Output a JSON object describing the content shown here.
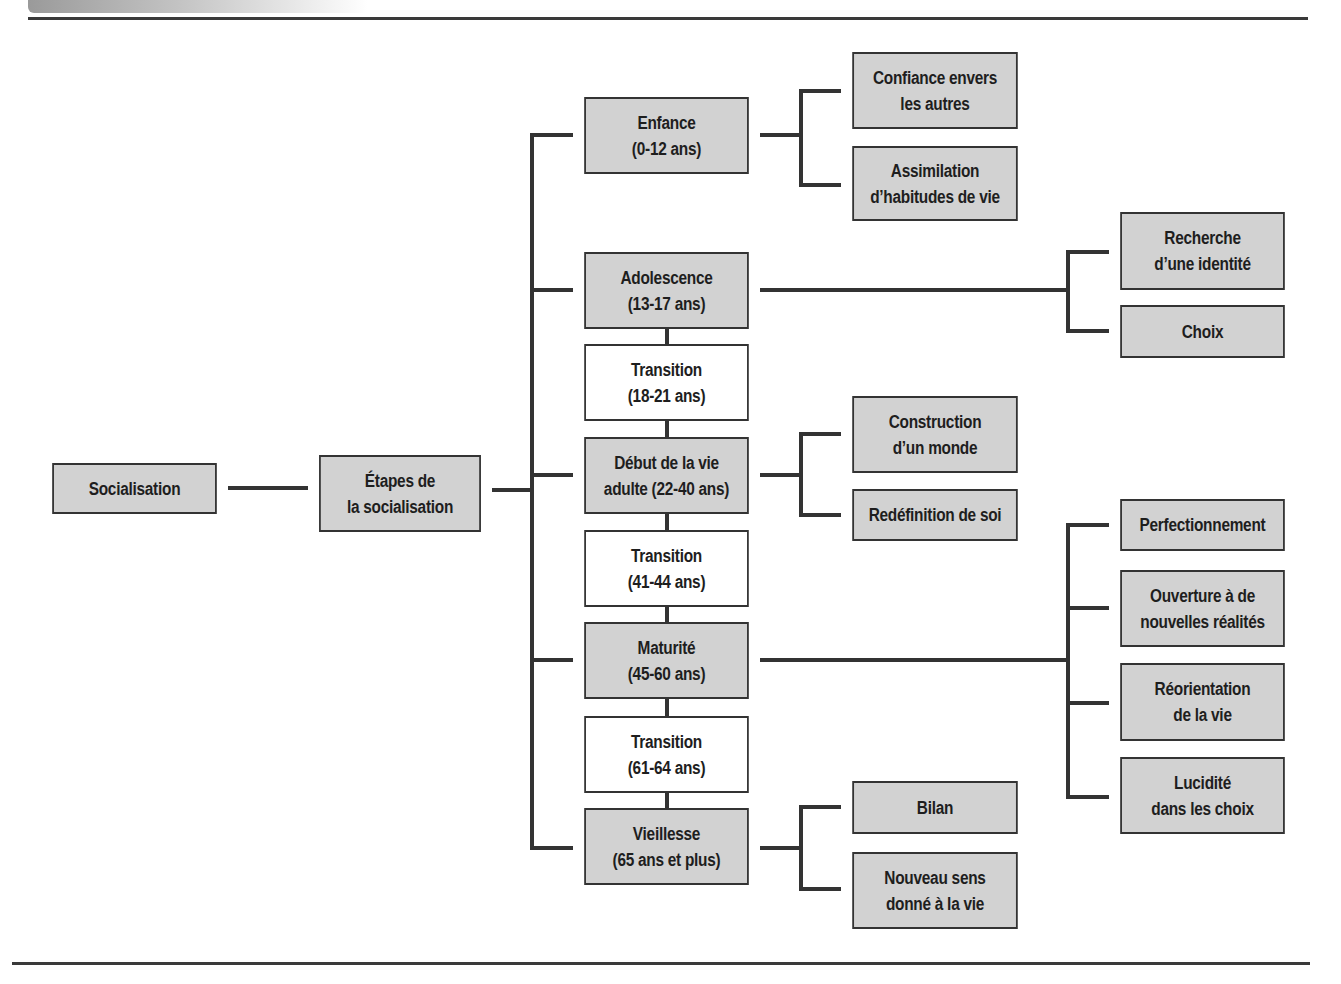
{
  "diagram": {
    "root": {
      "label": "Socialisation"
    },
    "stages_node": {
      "label": "Étapes de\nla socialisation"
    },
    "stages": [
      {
        "label": "Enfance\n(0-12 ans)",
        "type": "stage",
        "children": [
          "Confiance envers\nles autres",
          "Assimilation\nd’habitudes de vie"
        ]
      },
      {
        "label": "Adolescence\n(13-17 ans)",
        "type": "stage",
        "children": [
          "Recherche\nd’une identité",
          "Choix"
        ]
      },
      {
        "label": "Transition\n(18-21 ans)",
        "type": "transition",
        "children": []
      },
      {
        "label": "Début de la vie\nadulte (22-40 ans)",
        "type": "stage",
        "children": [
          "Construction\nd’un monde",
          "Redéfinition de soi"
        ]
      },
      {
        "label": "Transition\n(41-44 ans)",
        "type": "transition",
        "children": []
      },
      {
        "label": "Maturité\n(45-60 ans)",
        "type": "stage",
        "children": [
          "Perfectionnement",
          "Ouverture à de\nnouvelles réalités",
          "Réorientation\nde la vie",
          "Lucidité\ndans les choix"
        ]
      },
      {
        "label": "Transition\n(61-64 ans)",
        "type": "transition",
        "children": []
      },
      {
        "label": "Vieillesse\n(65 ans et plus)",
        "type": "stage",
        "children": [
          "Bilan",
          "Nouveau sens\ndonné à la vie"
        ]
      }
    ]
  },
  "colors": {
    "box_fill": "#d2d2d2",
    "transition_fill": "#ffffff",
    "line": "#333333",
    "text": "#1e1e1e"
  }
}
